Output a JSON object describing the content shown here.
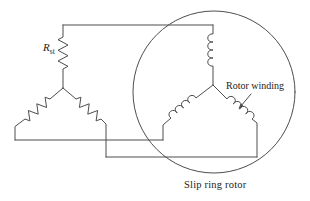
{
  "figure": {
    "type": "circuit-diagram",
    "labels": {
      "starting_resistor": {
        "base": "R",
        "sub": "st"
      },
      "rotor_winding": "Rotor winding",
      "slip_ring_rotor": "Slip ring rotor"
    },
    "symbols": [
      "resistor-zigzag-star",
      "inductor-coil-star",
      "slip-ring-rotor-circle",
      "annotation-arrow"
    ],
    "colors": {
      "line": "#4d4d4d",
      "text": "#1c1c1c",
      "background": "#ffffff"
    }
  }
}
